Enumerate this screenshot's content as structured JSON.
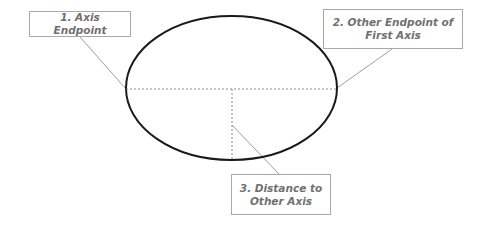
{
  "diagram": {
    "labels": [
      {
        "id": "1",
        "text": "1. Axis Endpoint"
      },
      {
        "id": "2",
        "text": "2. Other Endpoint of First Axis"
      },
      {
        "id": "3",
        "text": "3. Distance to Other Axis"
      }
    ],
    "ellipse": {
      "cx": 231.5,
      "cy": 88,
      "rx": 105.5,
      "ry": 72,
      "stroke": "#1a1a1a"
    },
    "colors": {
      "leader_line": "#a0a0a0",
      "dashed_line": "#8c8c8c",
      "label_text": "#707070",
      "label_border": "#a8a8a8"
    }
  }
}
